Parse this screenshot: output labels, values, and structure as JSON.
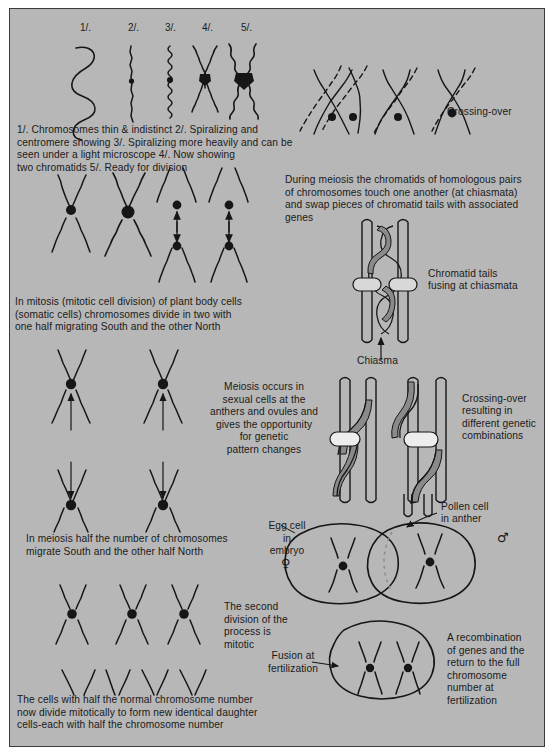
{
  "figure": {
    "background_color": "#b7b7b7",
    "ink_color": "#161616",
    "frame_border_color": "#3b3b3b",
    "shaded_chromatid_color": "#8a8a8a"
  },
  "stage_labels": [
    {
      "id": "1",
      "text": "1/.",
      "x": 80,
      "y": 22
    },
    {
      "id": "2",
      "text": "2/.",
      "x": 128,
      "y": 22
    },
    {
      "id": "3",
      "text": "3/.",
      "x": 165,
      "y": 22
    },
    {
      "id": "4",
      "text": "4/.",
      "x": 202,
      "y": 22
    },
    {
      "id": "5",
      "text": "5/.",
      "x": 241,
      "y": 22
    }
  ],
  "captions": {
    "stages": "1/. Chromosomes thin & indistinct 2/. Spiralizing and\ncentromere showing 3/. Spiralizing more heavily and can be\nseen under a light microscope 4/. Now showing\ntwo chromatids 5/. Ready for division",
    "crossing_over_label": "Crossing-over",
    "meiosis_chiasmata": "During meiosis the chromatids of homologous pairs\nof chromosomes touch one another (at chiasmata)\nand swap pieces of chromatid tails with associated\ngenes",
    "chromatid_tails": "Chromatid tails\nfusing at chiasmata",
    "chiasma_label": "Chiasma",
    "mitosis": "In mitosis (mitotic cell division) of plant body cells\n(somatic cells) chromosomes divide in two with\none half migrating South and the other North",
    "meiosis_sexual": "Meiosis occurs in\nsexual cells at the\nanthers and ovules and\ngives the opportunity\nfor genetic\npattern changes",
    "crossing_over_result": "Crossing-over\nresulting in\ndifferent genetic\ncombinations",
    "meiosis_half": "In meiosis half the number of chromosomes\nmigrate South and the other half North",
    "egg_cell": "Egg cell\n   in\nembryo",
    "egg_symbol": "♀",
    "pollen_cell": "Pollen cell\nin anther",
    "pollen_symbol": "♂",
    "second_division": "The second\ndivision of the\nprocess is\nmitotic",
    "fusion": "Fusion at\nfertilization",
    "recombination": "A recombination\nof genes and the\nreturn to the full\nchromosome\nnumber at\nfertilization",
    "daughter_cells": "The cells with half the normal chromosome number\nnow divide mitotically to form new identical daughter\ncells-each with half the chromosome number"
  }
}
